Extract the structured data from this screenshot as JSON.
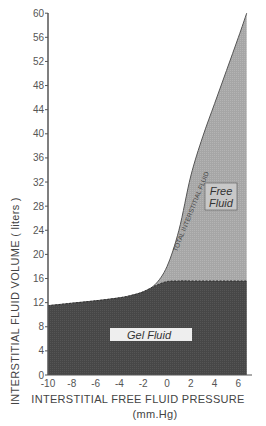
{
  "chart_data": {
    "type": "area",
    "title": "",
    "xlabel": "INTERSTITIAL FREE FLUID PRESSURE",
    "xlabel_units": "(mm.Hg)",
    "ylabel": "INTERSTITIAL FLUID VOLUME (liters)",
    "xlim": [
      -10,
      6.7
    ],
    "ylim": [
      0,
      60
    ],
    "x_ticks": [
      "-10",
      "-8",
      "-6",
      "-4",
      "-2",
      "0",
      "2",
      "4",
      "6"
    ],
    "y_ticks": [
      "0",
      "4",
      "8",
      "12",
      "16",
      "20",
      "24",
      "28",
      "32",
      "36",
      "40",
      "44",
      "48",
      "52",
      "56",
      "60"
    ],
    "grid": false,
    "x": [
      -10,
      -8,
      -6,
      -4,
      -3,
      -2,
      -1,
      0,
      1,
      2,
      3,
      4,
      5,
      6,
      6.7
    ],
    "series": [
      {
        "name": "Total Interstitial Fluid",
        "values": [
          11.5,
          11.9,
          12.3,
          12.8,
          13.2,
          13.8,
          15.0,
          18.0,
          24.0,
          33.0,
          39.5,
          45.0,
          50.5,
          56.0,
          60.0
        ]
      },
      {
        "name": "Gel Fluid",
        "values": [
          11.5,
          11.9,
          12.3,
          12.8,
          13.2,
          13.8,
          14.8,
          15.5,
          15.6,
          15.6,
          15.6,
          15.6,
          15.6,
          15.6,
          15.6
        ]
      }
    ],
    "annotations": [
      {
        "text": "TOTAL INTERSTITIAL FLUID",
        "position": "along total curve"
      },
      {
        "text": "Free Fluid",
        "region": "between total and gel curves"
      },
      {
        "text": "Gel Fluid",
        "region": "below gel curve"
      }
    ]
  },
  "labels": {
    "ylabel": "INTERSTITIAL FLUID VOLUME ( liters )",
    "xlabel": "INTERSTITIAL FREE FLUID PRESSURE",
    "xunits": "(mm.Hg)",
    "total_curve": "TOTAL  INTERSTITIAL  FLUID",
    "free_fluid_1": "Free",
    "free_fluid_2": "Fluid",
    "gel_fluid": "Gel Fluid"
  },
  "colors": {
    "gel": "#4a4a4a",
    "free": "#a9a9a9",
    "axis": "#555555"
  }
}
